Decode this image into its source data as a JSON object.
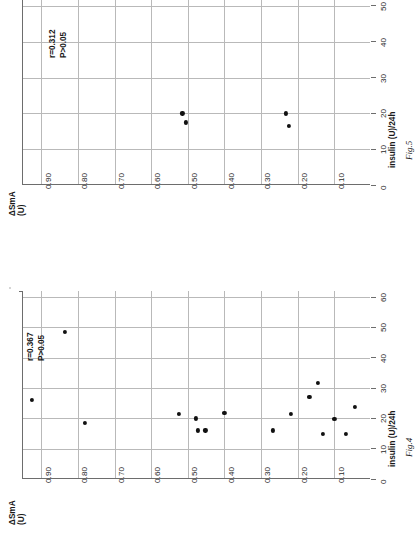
{
  "page": {
    "title": "Scatter plots of insulin dose versus delta-SmA"
  },
  "figures": [
    {
      "id": "fig5",
      "caption": "Fig.5",
      "stats": {
        "r": "r=0.312",
        "p": "P>0.05"
      },
      "chart_data": {
        "type": "scatter",
        "title": "Fig.5",
        "orientation": "rotated-90",
        "xlabel": "insulin (U)/24h",
        "ylabel": "ΔSmA (U)",
        "xlim": [
          0,
          55
        ],
        "ylim": [
          0,
          0.95
        ],
        "xticks": [
          0,
          10,
          20,
          30,
          40,
          50
        ],
        "xticklabels": [
          "0",
          "10",
          "20",
          "30",
          "40",
          "50"
        ],
        "yticks": [
          0.1,
          0.2,
          0.3,
          0.4,
          0.5,
          0.6,
          0.7,
          0.8,
          0.9
        ],
        "yticklabels": [
          "0.10",
          "0.20",
          "0.30",
          "0.40",
          "0.50",
          "0.60",
          "0.70",
          "0.80",
          "0.90"
        ],
        "grid": true,
        "legend": "none",
        "annotations": [
          "r=0.312",
          "P>0.05"
        ],
        "points": [
          {
            "x": 20.0,
            "y": 0.515
          },
          {
            "x": 17.5,
            "y": 0.505
          },
          {
            "x": 20.0,
            "y": 0.232
          },
          {
            "x": 16.5,
            "y": 0.225
          }
        ]
      }
    },
    {
      "id": "fig4",
      "caption": "Fig.4",
      "stats": {
        "r": "r=0.367",
        "p": "P>0.05"
      },
      "chart_data": {
        "type": "scatter",
        "title": "Fig.4",
        "orientation": "rotated-90",
        "xlabel": "insulin (U)/24h",
        "ylabel": "ΔSmA (U)",
        "xlim": [
          0,
          62
        ],
        "ylim": [
          0,
          0.95
        ],
        "xticks": [
          0,
          10,
          20,
          30,
          40,
          50,
          60
        ],
        "xticklabels": [
          "0",
          "10",
          "20",
          "30",
          "40",
          "50",
          "60"
        ],
        "yticks": [
          0.1,
          0.2,
          0.3,
          0.4,
          0.5,
          0.6,
          0.7,
          0.8,
          0.9
        ],
        "yticklabels": [
          "0.10",
          "0.20",
          "0.30",
          "0.40",
          "0.50",
          "0.60",
          "0.70",
          "0.80",
          "0.90"
        ],
        "grid": true,
        "legend": "none",
        "annotations": [
          "r=0.367",
          "P>0.05"
        ],
        "points": [
          {
            "x": 26.0,
            "y": 0.925
          },
          {
            "x": 48.5,
            "y": 0.835
          },
          {
            "x": 18.5,
            "y": 0.78
          },
          {
            "x": 21.5,
            "y": 0.525
          },
          {
            "x": 20.0,
            "y": 0.478
          },
          {
            "x": 16.0,
            "y": 0.472
          },
          {
            "x": 16.0,
            "y": 0.452
          },
          {
            "x": 21.8,
            "y": 0.4
          },
          {
            "x": 16.0,
            "y": 0.268
          },
          {
            "x": 21.5,
            "y": 0.218
          },
          {
            "x": 27.0,
            "y": 0.168
          },
          {
            "x": 31.8,
            "y": 0.145
          },
          {
            "x": 14.8,
            "y": 0.132
          },
          {
            "x": 19.8,
            "y": 0.1
          },
          {
            "x": 14.8,
            "y": 0.068
          },
          {
            "x": 23.8,
            "y": 0.045
          }
        ]
      }
    }
  ]
}
